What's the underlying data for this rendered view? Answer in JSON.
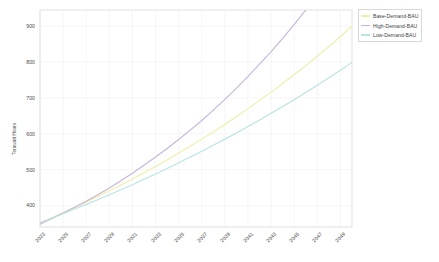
{
  "chart_data": {
    "type": "line",
    "title": "",
    "xlabel": "",
    "ylabel": "Terawatt Hours",
    "grid": true,
    "legend_position": "right-top",
    "xlim": [
      2023,
      2050
    ],
    "ylim": [
      340,
      945
    ],
    "yticks": [
      400,
      500,
      600,
      700,
      800,
      900
    ],
    "xticks": [
      "2023",
      "2025",
      "2027",
      "2029",
      "2031",
      "2033",
      "2035",
      "2037",
      "2039",
      "2041",
      "2043",
      "2045",
      "2047",
      "2049"
    ],
    "x": [
      2023,
      2024,
      2025,
      2026,
      2027,
      2028,
      2029,
      2030,
      2031,
      2032,
      2033,
      2034,
      2035,
      2036,
      2037,
      2038,
      2039,
      2040,
      2041,
      2042,
      2043,
      2044,
      2045,
      2046,
      2047,
      2048,
      2049,
      2050
    ],
    "series": [
      {
        "name": "Base-Demand-BAU",
        "color": "#eeeeaa",
        "values": [
          352,
          366,
          380,
          395,
          410,
          425,
          441,
          457,
          474,
          491,
          509,
          527,
          546,
          565,
          585,
          605,
          626,
          648,
          670,
          693,
          716,
          740,
          765,
          790,
          816,
          843,
          871,
          900
        ]
      },
      {
        "name": "High-Demand-BAU",
        "color": "#c8b4d8",
        "values": [
          348,
          363,
          379,
          395,
          412,
          430,
          449,
          469,
          490,
          512,
          535,
          559,
          584,
          610,
          637,
          666,
          696,
          727,
          760,
          794,
          829,
          866,
          905,
          945,
          987,
          1030,
          1075,
          1122
        ]
      },
      {
        "name": "Low-Demand-BAU",
        "color": "#b9e3e3",
        "values": [
          352,
          364,
          377,
          390,
          403,
          416,
          430,
          444,
          458,
          473,
          488,
          503,
          519,
          535,
          551,
          568,
          585,
          602,
          620,
          638,
          657,
          676,
          695,
          715,
          735,
          756,
          777,
          799
        ]
      }
    ]
  },
  "plot": {
    "frame_color": "#d9d9d9",
    "grid_color": "#f0f0f0"
  },
  "legend": {
    "items": [
      {
        "label": "Base-Demand-BAU"
      },
      {
        "label": "High-Demand-BAU"
      },
      {
        "label": "Low-Demand-BAU"
      }
    ]
  }
}
